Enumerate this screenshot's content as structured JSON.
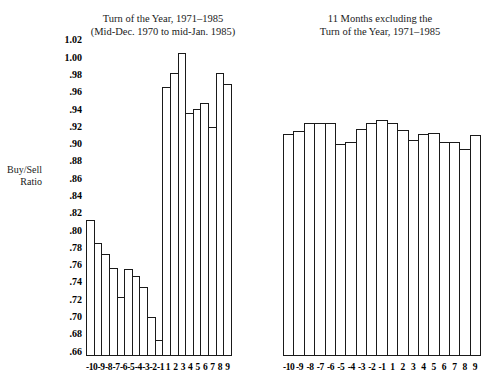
{
  "axis_label": "Buy/Sell\nRatio",
  "axis_label_line1": "Buy/Sell",
  "axis_label_line2": "Ratio",
  "left_panel": {
    "title_line1": "Turn of the Year, 1971–1985",
    "title_line2": "(Mid-Dec. 1970 to mid-Jan. 1985)"
  },
  "right_panel": {
    "title_line1": "11 Months excluding the",
    "title_line2": "Turn of the Year, 1971–1985"
  },
  "chart_data": [
    {
      "type": "bar",
      "title": "Turn of the Year, 1971–1985 (Mid-Dec. 1970 to mid-Jan. 1985)",
      "xlabel": "",
      "ylabel": "Buy/Sell Ratio",
      "ylim": [
        0.655,
        1.025
      ],
      "yticks": [
        1.02,
        1.0,
        0.98,
        0.96,
        0.94,
        0.92,
        0.9,
        0.88,
        0.86,
        0.84,
        0.82,
        0.8,
        0.78,
        0.76,
        0.74,
        0.72,
        0.7,
        0.68,
        0.66
      ],
      "ytick_labels": [
        "1.02",
        "1.00",
        ".98",
        ".96",
        ".94",
        ".92",
        ".90",
        ".88",
        ".86",
        ".84",
        ".82",
        ".80",
        ".78",
        ".76",
        ".74",
        ".72",
        ".70",
        ".68",
        ".66"
      ],
      "grid": false,
      "legend": "none",
      "categories": [
        "-10",
        "-9",
        "-8",
        "-7",
        "-6",
        "-5",
        "-4",
        "-3",
        "-2",
        "-1",
        "1",
        "2",
        "3",
        "4",
        "5",
        "6",
        "7",
        "8",
        "9"
      ],
      "values": [
        0.812,
        0.786,
        0.773,
        0.757,
        0.723,
        0.756,
        0.748,
        0.735,
        0.7,
        0.673,
        0.966,
        0.982,
        1.005,
        0.936,
        0.941,
        0.948,
        0.92,
        0.982,
        0.969
      ]
    },
    {
      "type": "bar",
      "title": "11 Months excluding the Turn of the Year, 1971–1985",
      "xlabel": "",
      "ylabel": "Buy/Sell Ratio",
      "ylim": [
        0.655,
        1.025
      ],
      "yticks": [
        1.02,
        1.0,
        0.98,
        0.96,
        0.94,
        0.92,
        0.9,
        0.88,
        0.86,
        0.84,
        0.82,
        0.8,
        0.78,
        0.76,
        0.74,
        0.72,
        0.7,
        0.68,
        0.66
      ],
      "grid": false,
      "legend": "none",
      "categories": [
        "-10",
        "-9",
        "-8",
        "-7",
        "-6",
        "-5",
        "-4",
        "-3",
        "-2",
        "-1",
        "1",
        "2",
        "3",
        "4",
        "5",
        "6",
        "7",
        "8",
        "9"
      ],
      "values": [
        0.912,
        0.915,
        0.925,
        0.924,
        0.925,
        0.9,
        0.902,
        0.918,
        0.924,
        0.928,
        0.924,
        0.916,
        0.905,
        0.912,
        0.913,
        0.902,
        0.902,
        0.894,
        0.911
      ]
    }
  ]
}
